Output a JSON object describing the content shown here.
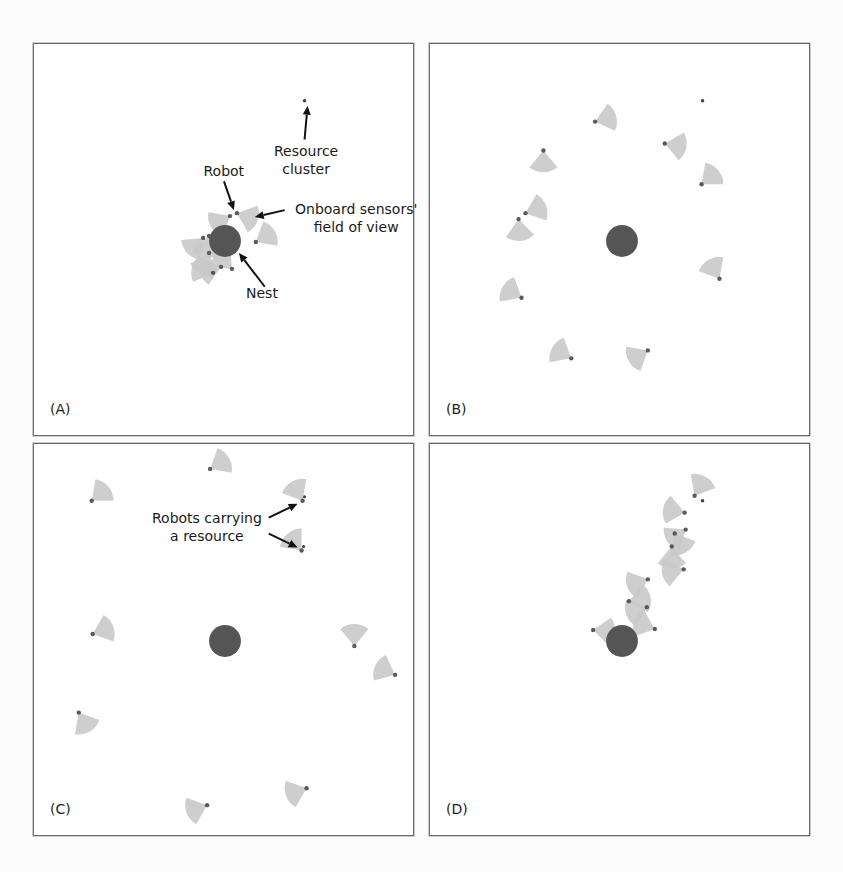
{
  "figure": {
    "colors": {
      "nest": "#555555",
      "sensor_fov": "#c9c9c9",
      "robot": "#5a5a5a",
      "resource": "#444444",
      "border": "#6a6a6a",
      "annotation": "#1a1a1a"
    },
    "panels": [
      {
        "id": "A",
        "label": "(A)",
        "nest": {
          "x": 192,
          "y": 198,
          "r": 16
        },
        "resources": [
          {
            "x": 272,
            "y": 57
          }
        ],
        "robots": [
          {
            "x": 197,
            "y": 173,
            "dir": 210
          },
          {
            "x": 204,
            "y": 170,
            "dir": 340
          },
          {
            "x": 170,
            "y": 195,
            "dir": 225
          },
          {
            "x": 176,
            "y": 193,
            "dir": 260
          },
          {
            "x": 176,
            "y": 210,
            "dir": 250
          },
          {
            "x": 188,
            "y": 224,
            "dir": 195
          },
          {
            "x": 199,
            "y": 226,
            "dir": 135
          },
          {
            "x": 180,
            "y": 230,
            "dir": 165
          },
          {
            "x": 223,
            "y": 199,
            "dir": 30
          }
        ],
        "annotations": [
          {
            "text": [
              "Resource",
              "cluster"
            ],
            "x": 272,
            "y": 98,
            "arrow": {
              "from": [
                272,
                96
              ],
              "to": [
                275,
                62
              ]
            }
          },
          {
            "text": [
              "Robot"
            ],
            "x": 190,
            "y": 118,
            "arrow": {
              "from": [
                191,
                138
              ],
              "to": [
                201,
                167
              ]
            }
          },
          {
            "text": [
              "Onboard sensors'",
              "field of view"
            ],
            "x": 322,
            "y": 156,
            "arrow": {
              "from": [
                252,
                167
              ],
              "to": [
                222,
                174
              ]
            }
          },
          {
            "text": [
              "Nest"
            ],
            "x": 228,
            "y": 240,
            "arrow": {
              "from": [
                232,
                244
              ],
              "to": [
                206,
                210
              ]
            }
          }
        ]
      },
      {
        "id": "B",
        "label": "(B)",
        "nest": {
          "x": 193,
          "y": 198,
          "r": 16
        },
        "resources": [
          {
            "x": 274,
            "y": 57
          }
        ],
        "robots": [
          {
            "x": 166,
            "y": 78,
            "dir": 15
          },
          {
            "x": 114,
            "y": 107,
            "dir": 270
          },
          {
            "x": 236,
            "y": 100,
            "dir": 350
          },
          {
            "x": 273,
            "y": 141,
            "dir": 40
          },
          {
            "x": 96,
            "y": 170,
            "dir": 20
          },
          {
            "x": 89,
            "y": 176,
            "dir": 275
          },
          {
            "x": 92,
            "y": 255,
            "dir": 150
          },
          {
            "x": 142,
            "y": 316,
            "dir": 150
          },
          {
            "x": 219,
            "y": 308,
            "dir": 210
          },
          {
            "x": 291,
            "y": 236,
            "dir": 120
          }
        ],
        "annotations": []
      },
      {
        "id": "C",
        "label": "(C)",
        "nest": {
          "x": 192,
          "y": 198,
          "r": 16
        },
        "resources": [],
        "robots": [
          {
            "x": 177,
            "y": 25,
            "dir": 30
          },
          {
            "x": 58,
            "y": 57,
            "dir": 40
          },
          {
            "x": 270,
            "y": 57,
            "dir": 120,
            "carrying": true
          },
          {
            "x": 269,
            "y": 107,
            "dir": 130,
            "carrying": true
          },
          {
            "x": 59,
            "y": 191,
            "dir": 20
          },
          {
            "x": 322,
            "y": 203,
            "dir": 90
          },
          {
            "x": 363,
            "y": 232,
            "dir": 155
          },
          {
            "x": 45,
            "y": 270,
            "dir": 300
          },
          {
            "x": 174,
            "y": 363,
            "dir": 200
          },
          {
            "x": 274,
            "y": 346,
            "dir": 200
          }
        ],
        "annotations": [
          {
            "text": [
              "Robots carrying",
              "a resource"
            ],
            "x": 173,
            "y": 65,
            "arrows": [
              {
                "from": [
                  236,
                  74
                ],
                "to": [
                  265,
                  60
                ]
              },
              {
                "from": [
                  236,
                  90
                ],
                "to": [
                  265,
                  104
                ]
              }
            ]
          }
        ]
      },
      {
        "id": "D",
        "label": "(D)",
        "nest": {
          "x": 193,
          "y": 198,
          "r": 16
        },
        "resources": [
          {
            "x": 274,
            "y": 57
          }
        ],
        "robots": [
          {
            "x": 266,
            "y": 52,
            "dir": 60
          },
          {
            "x": 256,
            "y": 69,
            "dir": 170
          },
          {
            "x": 257,
            "y": 86,
            "dir": 215
          },
          {
            "x": 246,
            "y": 90,
            "dir": 300
          },
          {
            "x": 243,
            "y": 103,
            "dir": 270
          },
          {
            "x": 255,
            "y": 126,
            "dir": 190
          },
          {
            "x": 219,
            "y": 136,
            "dir": 200
          },
          {
            "x": 200,
            "y": 158,
            "dir": 10
          },
          {
            "x": 218,
            "y": 164,
            "dir": 200
          },
          {
            "x": 164,
            "y": 187,
            "dir": 355
          },
          {
            "x": 226,
            "y": 186,
            "dir": 160
          }
        ],
        "annotations": []
      }
    ]
  },
  "background_ghost_text": "",
  "chart_data": {
    "type": "diagram",
    "title": "",
    "panels": [
      "(A)",
      "(B)",
      "(C)",
      "(D)"
    ],
    "labels": [
      "Resource cluster",
      "Robot",
      "Onboard sensors' field of view",
      "Nest",
      "Robots carrying a resource"
    ]
  }
}
